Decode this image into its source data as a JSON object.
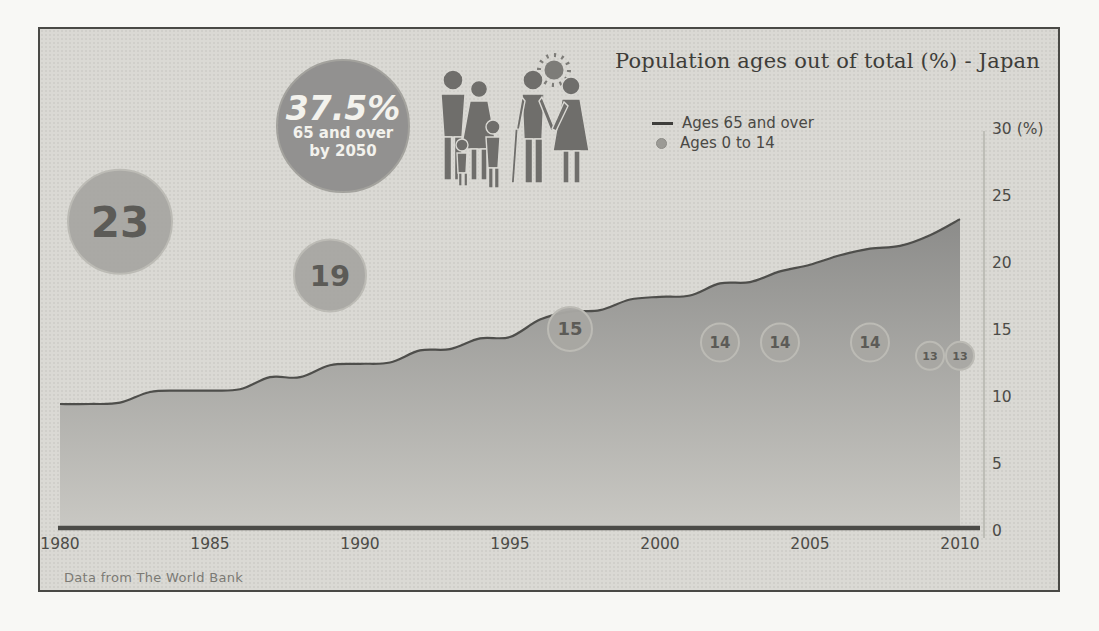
{
  "title": "Population ages out of total (%) - Japan",
  "footer": "Data from The World Bank",
  "legend": [
    {
      "swatch": "line-swatch",
      "label": "Ages 65 and over"
    },
    {
      "swatch": "dot-swatch",
      "label": "Ages 0 to 14"
    }
  ],
  "badge": {
    "value": "37.5%",
    "line2": "65 and over",
    "line3": "by 2050"
  },
  "icons": [
    "sun-icon",
    "family-icon",
    "elderly-couple-icon"
  ],
  "colors": {
    "panel_background": "#dad9d4",
    "panel_border": "#4a4a46",
    "area_top": "#8c8c8a",
    "area_bottom": "#c9c8c3",
    "area_line": "#4e4e4b",
    "axis_line": "#4b4b47",
    "y_axis_line": "#b5b4ae",
    "bubble_fill": "#a8a7a2",
    "bubble_stroke": "#bcbbb5",
    "bubble_text": "#5c5b57",
    "badge_fill": "#929190",
    "figure_fill": "#6f6e6b"
  },
  "chart_data": {
    "type": "area",
    "title": "Population ages out of total (%) - Japan",
    "xlabel": "",
    "ylabel": "(%)",
    "y_axis_unit": "(%)",
    "xlim": [
      1980,
      2010
    ],
    "ylim": [
      0,
      30
    ],
    "x_ticks": [
      1980,
      1985,
      1990,
      1995,
      2000,
      2005,
      2010
    ],
    "y_ticks": [
      0,
      5,
      10,
      15,
      20,
      25,
      30
    ],
    "grid": false,
    "legend_position": "top-right",
    "series": [
      {
        "name": "Ages 65 and over",
        "type": "area",
        "x": [
          1980,
          1981,
          1982,
          1983,
          1984,
          1985,
          1986,
          1987,
          1988,
          1989,
          1990,
          1991,
          1992,
          1993,
          1994,
          1995,
          1996,
          1997,
          1998,
          1999,
          2000,
          2001,
          2002,
          2003,
          2004,
          2005,
          2006,
          2007,
          2008,
          2009,
          2010
        ],
        "values": [
          9.4,
          9.4,
          9.5,
          10.3,
          10.4,
          10.4,
          10.5,
          11.4,
          11.4,
          12.3,
          12.4,
          12.5,
          13.4,
          13.5,
          14.3,
          14.4,
          15.7,
          16.3,
          16.4,
          17.2,
          17.4,
          17.5,
          18.4,
          18.5,
          19.3,
          19.8,
          20.5,
          21.0,
          21.2,
          22.0,
          23.2
        ]
      },
      {
        "name": "Ages 0 to 14",
        "type": "bubble",
        "points": [
          {
            "year": 1982,
            "value": 23,
            "label": "23",
            "radius": 52
          },
          {
            "year": 1989,
            "value": 19,
            "label": "19",
            "radius": 36
          },
          {
            "year": 1997,
            "value": 15,
            "label": "15",
            "radius": 22
          },
          {
            "year": 2002,
            "value": 14,
            "label": "14",
            "radius": 19
          },
          {
            "year": 2004,
            "value": 14,
            "label": "14",
            "radius": 19
          },
          {
            "year": 2007,
            "value": 14,
            "label": "14",
            "radius": 19
          },
          {
            "year": 2009,
            "value": 13,
            "label": "13",
            "radius": 14
          },
          {
            "year": 2010,
            "value": 13,
            "label": "13",
            "radius": 14
          }
        ]
      }
    ],
    "annotation": {
      "text": "37.5% 65 and over by 2050"
    }
  }
}
